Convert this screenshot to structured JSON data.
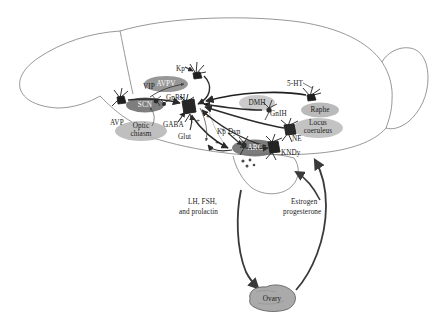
{
  "figure": {
    "type": "neuroendocrine-circuit-diagram",
    "width": 441,
    "height": 324,
    "background": "#ffffff",
    "outline_color": "#7a7a7a",
    "arrow_color": "#2b2b2b"
  },
  "nuclei": [
    {
      "id": "avpv",
      "label": "AVPV",
      "fill": "#8c8c8c",
      "text": "#ffffff",
      "cx": 166,
      "cy": 84,
      "rx": 22,
      "ry": 8
    },
    {
      "id": "scn",
      "label": "SCN",
      "fill": "#707070",
      "text": "#ffffff",
      "cx": 145,
      "cy": 105,
      "rx": 19,
      "ry": 7.5
    },
    {
      "id": "optic",
      "label": "Optic\nchiasm",
      "fill": "#b4b4b4",
      "text": "#2a2a2a",
      "cx": 141,
      "cy": 131,
      "rx": 26,
      "ry": 10
    },
    {
      "id": "dmh",
      "label": "DMH",
      "fill": "#c2c2c2",
      "text": "#2a2a2a",
      "cx": 257,
      "cy": 103,
      "rx": 18,
      "ry": 8
    },
    {
      "id": "raphe",
      "label": "Raphe",
      "fill": "#b0b0b0",
      "text": "#2a2a2a",
      "cx": 320,
      "cy": 110,
      "rx": 19,
      "ry": 7.5
    },
    {
      "id": "lc",
      "label": "Locus\ncoeruleus",
      "fill": "#b8b8b8",
      "text": "#2a2a2a",
      "cx": 318,
      "cy": 128,
      "rx": 25,
      "ry": 10
    },
    {
      "id": "arc",
      "label": "ARC",
      "fill": "#6e6e6e",
      "text": "#f2f2f2",
      "cx": 255,
      "cy": 148,
      "rx": 23,
      "ry": 8.5
    },
    {
      "id": "ovary",
      "label": "Ovary",
      "fill": "#aaaaaa",
      "text": "#2a2a2a",
      "cx": 272,
      "cy": 299,
      "rx": 24,
      "ry": 11
    }
  ],
  "labels": [
    {
      "id": "kp-avpv",
      "text": "Kp",
      "x": 176,
      "y": 65
    },
    {
      "id": "vip",
      "text": "VIP",
      "x": 143,
      "y": 83
    },
    {
      "id": "gnrh",
      "text": "GnRH",
      "x": 166,
      "y": 94
    },
    {
      "id": "avp",
      "text": "AVP",
      "x": 110,
      "y": 119
    },
    {
      "id": "gaba",
      "text": "GABA",
      "x": 163,
      "y": 121
    },
    {
      "id": "glut",
      "text": "Glut",
      "x": 178,
      "y": 133
    },
    {
      "id": "five-ht",
      "text": "5-HT",
      "x": 287,
      "y": 84
    },
    {
      "id": "gnih",
      "text": "GnIH",
      "x": 270,
      "y": 110
    },
    {
      "id": "ne",
      "text": "NE",
      "x": 292,
      "y": 137
    },
    {
      "id": "kp-dyn",
      "text": "Kp Dyn",
      "x": 218,
      "y": 129
    },
    {
      "id": "kndy",
      "text": "KNDy",
      "x": 281,
      "y": 151
    },
    {
      "id": "lh-fsh",
      "text": "LH, FSH,",
      "x": 188,
      "y": 201
    },
    {
      "id": "prolactin",
      "text": "and prolactin",
      "x": 180,
      "y": 210
    },
    {
      "id": "estrogen",
      "text": "Estrogen",
      "x": 291,
      "y": 201
    },
    {
      "id": "progesterone",
      "text": "progesterone",
      "x": 285,
      "y": 210
    }
  ],
  "signs": [
    {
      "id": "sign-1",
      "text": "+",
      "x": 179,
      "y": 96
    },
    {
      "id": "sign-2",
      "text": "+",
      "x": 179,
      "y": 113
    },
    {
      "id": "sign-3",
      "text": "+",
      "x": 196,
      "y": 119
    },
    {
      "id": "sign-4",
      "text": "+",
      "x": 204,
      "y": 103
    },
    {
      "id": "sign-5",
      "text": "+",
      "x": 206,
      "y": 115
    },
    {
      "id": "sign-6",
      "text": "+",
      "x": 216,
      "y": 141
    },
    {
      "id": "sign-7",
      "text": "+",
      "x": 210,
      "y": 148
    },
    {
      "id": "sign-8",
      "text": "+",
      "x": 220,
      "y": 128
    }
  ],
  "hormone_pathways": [
    {
      "id": "lh-fsh-prolactin",
      "from": "pituitary",
      "to": "ovary",
      "label": "LH, FSH, and prolactin"
    },
    {
      "id": "estrogen-prog",
      "from": "ovary",
      "to": "brain",
      "label": "Estrogen progesterone"
    }
  ],
  "neurotransmitters": [
    "Kp",
    "VIP",
    "GnRH",
    "AVP",
    "GABA",
    "Glut",
    "5-HT",
    "GnIH",
    "NE",
    "Kp Dyn",
    "KNDy"
  ]
}
